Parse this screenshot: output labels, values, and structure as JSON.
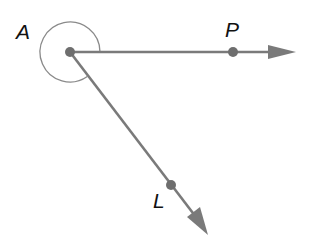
{
  "diagram": {
    "type": "geometry-angle",
    "colors": {
      "ray": "#7a7a7a",
      "arc": "#8a8a8a",
      "point": "#6e6e6e",
      "label": "#111111"
    },
    "points": {
      "A": {
        "label": "A",
        "x": 70,
        "y": 52
      },
      "P": {
        "label": "P",
        "x": 233,
        "y": 52
      },
      "L": {
        "label": "L",
        "x": 171,
        "y": 185
      }
    },
    "rays": [
      {
        "name": "ray-AP",
        "from": "A",
        "through": "P",
        "tip": [
          294,
          52
        ]
      },
      {
        "name": "ray-AL",
        "from": "A",
        "through": "L",
        "tip": [
          208,
          234
        ]
      }
    ],
    "angle_mark": {
      "type": "reflex-arc",
      "vertex": "A",
      "radius": 30
    }
  }
}
